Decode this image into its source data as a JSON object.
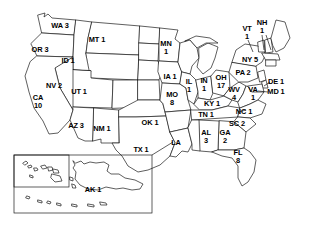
{
  "map": {
    "title": "United States choropleth-style map with state abbreviations and counts",
    "stroke_color": "#1a1a1a",
    "fill_color": "#ffffff",
    "background": "#ffffff"
  },
  "chart_data": {
    "type": "table",
    "xlabel": "",
    "ylabel": "",
    "categories": [
      "WA",
      "OR",
      "ID",
      "MT",
      "NV",
      "UT",
      "CA",
      "AZ",
      "NM",
      "MN",
      "IA",
      "MO",
      "OK",
      "TX",
      "IL",
      "IN",
      "OH",
      "WV",
      "KY",
      "TN",
      "NC",
      "SC",
      "GA",
      "AL",
      "FL",
      "LA",
      "VT",
      "NH",
      "NY",
      "PA",
      "DE",
      "MD",
      "VA",
      "AK"
    ],
    "values": [
      3,
      3,
      1,
      1,
      2,
      1,
      10,
      3,
      1,
      1,
      1,
      8,
      1,
      1,
      1,
      1,
      17,
      4,
      1,
      1,
      1,
      2,
      2,
      3,
      8,
      null,
      1,
      1,
      5,
      2,
      1,
      1,
      1,
      1
    ],
    "legend_position": "none",
    "grid": false
  },
  "labels": [
    {
      "name": "label-wa",
      "abbr": "WA",
      "count": "3",
      "text": "WA 3",
      "x": 60,
      "y": 26,
      "lines": 1
    },
    {
      "name": "label-or",
      "abbr": "OR",
      "count": "3",
      "text": "OR 3",
      "x": 40,
      "y": 50,
      "lines": 1
    },
    {
      "name": "label-id",
      "abbr": "ID",
      "count": "1",
      "text": "ID 1",
      "x": 68,
      "y": 61,
      "lines": 1
    },
    {
      "name": "label-mt",
      "abbr": "MT",
      "count": "1",
      "text": "MT 1",
      "x": 97,
      "y": 40,
      "lines": 1
    },
    {
      "name": "label-nv",
      "abbr": "NV",
      "count": "2",
      "text": "NV 2",
      "x": 54,
      "y": 86,
      "lines": 1
    },
    {
      "name": "label-ut",
      "abbr": "UT",
      "count": "1",
      "text": "UT 1",
      "x": 79,
      "y": 92,
      "lines": 1
    },
    {
      "name": "label-ca",
      "abbr": "CA",
      "count": "10",
      "text": "CA\n10",
      "x": 38,
      "y": 102,
      "lines": 2
    },
    {
      "name": "label-az",
      "abbr": "AZ",
      "count": "3",
      "text": "AZ 3",
      "x": 76,
      "y": 126,
      "lines": 1
    },
    {
      "name": "label-nm",
      "abbr": "NM",
      "count": "1",
      "text": "NM 1",
      "x": 102,
      "y": 129,
      "lines": 1
    },
    {
      "name": "label-mn",
      "abbr": "MN",
      "count": "1",
      "text": "MN\n1",
      "x": 166,
      "y": 48,
      "lines": 2
    },
    {
      "name": "label-ia",
      "abbr": "IA",
      "count": "1",
      "text": "IA 1",
      "x": 170,
      "y": 77,
      "lines": 1
    },
    {
      "name": "label-mo",
      "abbr": "MO",
      "count": "8",
      "text": "MO\n8",
      "x": 172,
      "y": 99,
      "lines": 2
    },
    {
      "name": "label-ok",
      "abbr": "OK",
      "count": "1",
      "text": "OK 1",
      "x": 150,
      "y": 123,
      "lines": 1
    },
    {
      "name": "label-tx",
      "abbr": "TX",
      "count": "1",
      "text": "TX 1",
      "x": 141,
      "y": 150,
      "lines": 1
    },
    {
      "name": "label-il",
      "abbr": "IL",
      "count": "1",
      "text": "IL\n1",
      "x": 189,
      "y": 86,
      "lines": 2
    },
    {
      "name": "label-in",
      "abbr": "IN",
      "count": "1",
      "text": "IN\n1",
      "x": 204,
      "y": 85,
      "lines": 2
    },
    {
      "name": "label-oh",
      "abbr": "OH",
      "count": "17",
      "text": "OH\n17",
      "x": 221,
      "y": 82,
      "lines": 2
    },
    {
      "name": "label-wv",
      "abbr": "WV",
      "count": "4",
      "text": "WV\n4",
      "x": 234,
      "y": 94,
      "lines": 2
    },
    {
      "name": "label-ky",
      "abbr": "KY",
      "count": "1",
      "text": "KY 1",
      "x": 212,
      "y": 104,
      "lines": 1
    },
    {
      "name": "label-tn",
      "abbr": "TN",
      "count": "1",
      "text": "TN 1",
      "x": 206,
      "y": 115,
      "lines": 1
    },
    {
      "name": "label-nc",
      "abbr": "NC",
      "count": "1",
      "text": "NC 1",
      "x": 244,
      "y": 112,
      "lines": 1
    },
    {
      "name": "label-sc",
      "abbr": "SC",
      "count": "2",
      "text": "SC 2",
      "x": 237,
      "y": 124,
      "lines": 1
    },
    {
      "name": "label-ga",
      "abbr": "GA",
      "count": "2",
      "text": "GA\n2",
      "x": 225,
      "y": 137,
      "lines": 2
    },
    {
      "name": "label-al",
      "abbr": "AL",
      "count": "3",
      "text": "AL\n3",
      "x": 206,
      "y": 137,
      "lines": 2
    },
    {
      "name": "label-fl",
      "abbr": "FL",
      "count": "8",
      "text": "FL\n8",
      "x": 238,
      "y": 157,
      "lines": 2
    },
    {
      "name": "label-la",
      "abbr": "LA",
      "count": "",
      "text": "LA",
      "x": 176,
      "y": 143,
      "lines": 1
    },
    {
      "name": "label-vt",
      "abbr": "VT",
      "count": "1",
      "text": "VT\n1",
      "x": 247,
      "y": 33,
      "lines": 2
    },
    {
      "name": "label-nh",
      "abbr": "NH",
      "count": "1",
      "text": "NH\n1",
      "x": 262,
      "y": 27,
      "lines": 2
    },
    {
      "name": "label-ny",
      "abbr": "NY",
      "count": "5",
      "text": "NY 5",
      "x": 250,
      "y": 60,
      "lines": 1
    },
    {
      "name": "label-pa",
      "abbr": "PA",
      "count": "2",
      "text": "PA 2",
      "x": 243,
      "y": 73,
      "lines": 1
    },
    {
      "name": "label-de",
      "abbr": "DE",
      "count": "1",
      "text": "DE 1",
      "x": 276,
      "y": 82,
      "lines": 1
    },
    {
      "name": "label-md",
      "abbr": "MD",
      "count": "1",
      "text": "MD 1",
      "x": 276,
      "y": 92,
      "lines": 1
    },
    {
      "name": "label-va",
      "abbr": "VA",
      "count": "1",
      "text": "VA\n1",
      "x": 253,
      "y": 94,
      "lines": 2
    },
    {
      "name": "label-ak",
      "abbr": "AK",
      "count": "1",
      "text": "AK 1",
      "x": 93,
      "y": 190,
      "lines": 1
    }
  ]
}
